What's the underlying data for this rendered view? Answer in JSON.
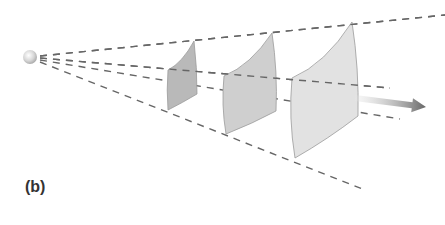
{
  "figure": {
    "panel_label": "(b)",
    "colors": {
      "ray": "#666666",
      "patch_fill_1": "#b9b9b9",
      "patch_fill_2": "#cfcfcf",
      "patch_fill_3": "#e2e2e2",
      "patch_edge": "#9a9a9a",
      "arrow": "#6e6e6e",
      "source": "#d8d8d8"
    },
    "source": {
      "cx": 30,
      "cy": 57,
      "r": 7
    },
    "rays": [
      {
        "x1": 40,
        "y1": 56,
        "x2": 445,
        "y2": 15
      },
      {
        "x1": 40,
        "y1": 58,
        "x2": 390,
        "y2": 88
      },
      {
        "x1": 40,
        "y1": 60,
        "x2": 400,
        "y2": 119
      },
      {
        "x1": 40,
        "y1": 62,
        "x2": 365,
        "y2": 190
      }
    ],
    "patches": [
      {
        "name": "patch-near",
        "tr": [
          194,
          41
        ],
        "tl": [
          168,
          70
        ],
        "bl": [
          168,
          110
        ],
        "br": [
          197,
          94
        ]
      },
      {
        "name": "patch-middle",
        "tr": [
          272,
          33
        ],
        "tl": [
          224,
          76
        ],
        "bl": [
          226,
          134
        ],
        "br": [
          276,
          111
        ]
      },
      {
        "name": "patch-far",
        "tr": [
          352,
          22
        ],
        "tl": [
          292,
          78
        ],
        "bl": [
          295,
          158
        ],
        "br": [
          358,
          116
        ]
      }
    ],
    "arrow": {
      "x1": 355,
      "y1": 98,
      "x2": 426,
      "y2": 107
    }
  }
}
